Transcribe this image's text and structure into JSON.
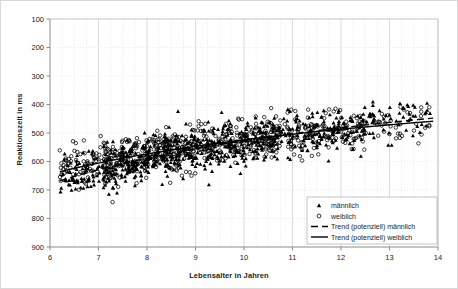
{
  "chart_data": {
    "type": "scatter",
    "title": "",
    "xlabel": "Lebensalter in Jahren",
    "ylabel": "Reaktionszeit in ms",
    "xlim": [
      6,
      14
    ],
    "ylim": [
      100,
      900
    ],
    "y_inverted": true,
    "xticks": [
      6,
      7,
      8,
      9,
      10,
      11,
      12,
      13,
      14
    ],
    "yticks": [
      100,
      200,
      300,
      400,
      500,
      600,
      700,
      800,
      900
    ],
    "xtick_labels": [
      "6",
      "7",
      "8",
      "9",
      "10",
      "11",
      "12",
      "13",
      "14"
    ],
    "ytick_labels": [
      "100",
      "200",
      "300",
      "400",
      "500",
      "600",
      "700",
      "800",
      "900"
    ],
    "grid": true,
    "grid_minor_x": true,
    "legend_position": "bottom-right",
    "series": [
      {
        "name": "männlich",
        "marker": "triangle",
        "color": "#000000",
        "n_points": 760,
        "x_range": [
          6.2,
          13.95
        ],
        "y_range": [
          180,
          890
        ],
        "trend": {
          "name": "Trend (potenziell) männlich",
          "style": "dashed",
          "color": "#000000",
          "model": "power",
          "y_at_x_min": 668,
          "y_at_x_max": 447
        }
      },
      {
        "name": "weiblich",
        "marker": "circle",
        "color": "#000000",
        "n_points": 700,
        "x_range": [
          6.2,
          13.95
        ],
        "y_range": [
          230,
          860
        ],
        "trend": {
          "name": "Trend (potenziell) weiblich",
          "style": "solid",
          "color": "#000000",
          "model": "power",
          "y_at_x_min": 636,
          "y_at_x_max": 458
        }
      }
    ],
    "legend_entries": [
      {
        "label": "männlich",
        "type": "marker",
        "marker": "triangle"
      },
      {
        "label": "weiblich",
        "type": "marker",
        "marker": "circle"
      },
      {
        "label": "Trend (potenziell)  männlich",
        "type": "line",
        "style": "dashed"
      },
      {
        "label": "Trend (potenziell) weiblich",
        "type": "line",
        "style": "solid"
      }
    ]
  },
  "colors": {
    "marker": "#000000",
    "grid": "#d6d6d6",
    "grid_minor": "#e8e8e8",
    "axis": "#808080",
    "frame": "#d9d9d9",
    "text": "#1a1a1a"
  }
}
